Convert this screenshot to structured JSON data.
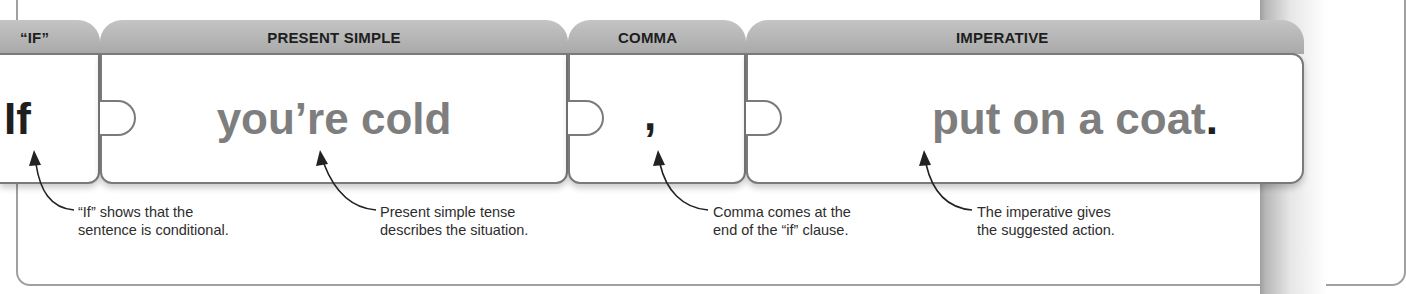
{
  "pieces": [
    {
      "id": "if",
      "tab_label": "“IF”",
      "content": "If",
      "note_line1": "“If” shows that the",
      "note_line2": "sentence is conditional."
    },
    {
      "id": "present-simple",
      "tab_label": "PRESENT SIMPLE",
      "content": "you’re cold",
      "note_line1": "Present simple tense",
      "note_line2": "describes the situation."
    },
    {
      "id": "comma",
      "tab_label": "COMMA",
      "content": ",",
      "note_line1": "Comma comes at the",
      "note_line2": "end of the “if” clause."
    },
    {
      "id": "imperative",
      "tab_label": "IMPERATIVE",
      "content": "put on a coat",
      "content_punct": ".",
      "note_line1": "The imperative gives",
      "note_line2": "the suggested action."
    }
  ],
  "colors": {
    "tab": "#b0b0b0",
    "content_gray": "#7e7e7e",
    "content_dark": "#1f1f1f",
    "border": "#7a7a7a"
  }
}
